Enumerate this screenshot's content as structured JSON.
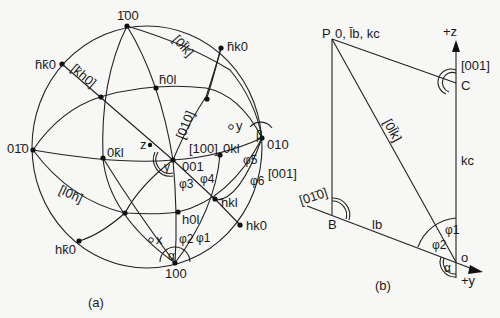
{
  "figure_a": {
    "caption": "(a)",
    "poles": {
      "p_bar100": "1̄00",
      "p_hbar_kbar0": "h̄k̄0",
      "p_hbar_k0": "h̄k0",
      "p_hbar0l": "h̄0l",
      "p_0bar10": "01̄0",
      "p_0kbar_l": "0k̄l",
      "p_z": "z",
      "p_y": "y",
      "p_001": "001",
      "p_0kl": "0kl",
      "p_010": "010",
      "p_hkl": "hkl",
      "p_h0l": "h0l",
      "p_hk0": "hk0",
      "p_h_kbar0": "hk̄0",
      "p_x": "x",
      "p_100": "100"
    },
    "zones": {
      "z_kbar_h0": "[k̄h0]",
      "z_0_lbar_k": "[0l̄k]",
      "z_010": "[010]",
      "z_100": "[100]",
      "z_001": "[001]",
      "z_l0_hbar": "[l0h̄]"
    },
    "angles": {
      "alpha": "α",
      "beta": "β",
      "gamma": "γ",
      "phi1": "φ1",
      "phi2": "φ2",
      "phi3": "φ3",
      "phi4": "φ4",
      "phi5": "φ5",
      "phi6": "φ6"
    }
  },
  "figure_b": {
    "caption": "(b)",
    "labels": {
      "P": "P",
      "P_coords": "0, l̄b, kc",
      "plus_z": "+z",
      "z_001": "[001]",
      "C": "C",
      "z_0lbar_k": "[0l̄k]",
      "kc": "kc",
      "z_0_1bar_0": "[01̄0]",
      "B": "B",
      "lb": "lb",
      "phi1": "φ1",
      "phi2": "φ2",
      "o": "o",
      "alpha": "α",
      "plus_y": "+y"
    }
  }
}
